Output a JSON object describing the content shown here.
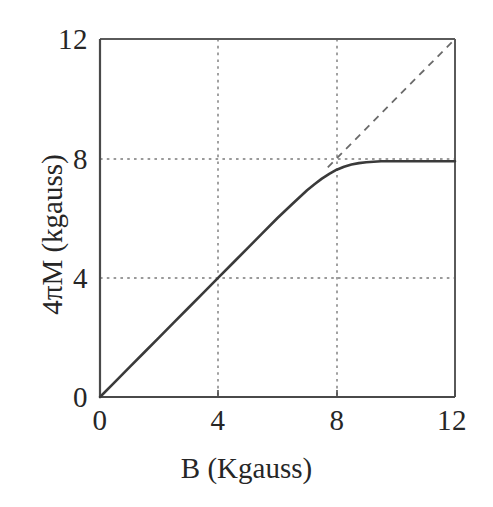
{
  "figure": {
    "background_color": "#ffffff",
    "line_color": "#3a3a3a",
    "frame_color": "#555555",
    "grid_color": "#777777"
  },
  "axes": {
    "x_title": "B (Kgauss)",
    "y_title": "4πM (kgauss)",
    "x_ticks": [
      "0",
      "4",
      "8",
      "12"
    ],
    "y_ticks": [
      "0",
      "4",
      "8",
      "12"
    ]
  },
  "chart_data": {
    "type": "line",
    "title": "",
    "xlabel": "B (Kgauss)",
    "ylabel": "4πM (kgauss)",
    "xlim": [
      0,
      12
    ],
    "ylim": [
      0,
      12
    ],
    "xticks": [
      0,
      4,
      8,
      12
    ],
    "yticks": [
      0,
      4,
      8,
      12
    ],
    "grid": true,
    "grid_style": "dotted",
    "grid_x": [
      4,
      8
    ],
    "grid_y": [
      4,
      8
    ],
    "legend": "none",
    "saturation_value": 7.9,
    "series": [
      {
        "name": "magnetization curve",
        "style": "solid",
        "color": "#3a3a3a",
        "x": [
          0,
          0.5,
          1,
          1.5,
          2,
          2.5,
          3,
          3.5,
          4,
          4.5,
          5,
          5.5,
          6,
          6.5,
          7,
          7.25,
          7.5,
          7.75,
          8,
          8.25,
          8.5,
          8.75,
          9,
          9.5,
          10,
          10.5,
          11,
          11.5,
          12
        ],
        "y": [
          0,
          0.5,
          1,
          1.5,
          2,
          2.5,
          3,
          3.5,
          4,
          4.5,
          5,
          5.5,
          6,
          6.47,
          6.93,
          7.13,
          7.32,
          7.48,
          7.62,
          7.72,
          7.79,
          7.84,
          7.87,
          7.9,
          7.9,
          7.9,
          7.9,
          7.9,
          7.9
        ]
      },
      {
        "name": "ideal line 4πM = B",
        "style": "dashed",
        "color": "#6a6a6a",
        "x": [
          7.7,
          12
        ],
        "y": [
          7.7,
          12
        ]
      }
    ]
  }
}
